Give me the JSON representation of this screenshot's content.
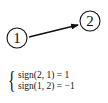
{
  "diagram": {
    "nodes": [
      {
        "id": "node-1",
        "label": "1"
      },
      {
        "id": "node-2",
        "label": "2"
      }
    ],
    "edges": [
      {
        "from": "node-1",
        "to": "node-2",
        "directed": true
      }
    ]
  },
  "equations": {
    "brace": "{",
    "lines": [
      "sign(2, 1) = 1",
      "sign(1, 2) = −1"
    ]
  }
}
